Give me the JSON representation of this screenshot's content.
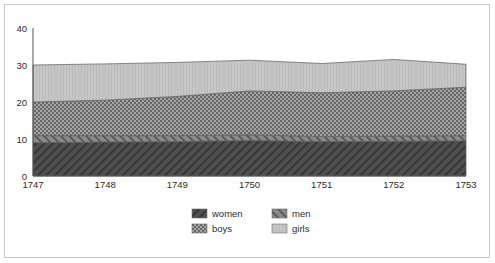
{
  "chart_data": {
    "type": "area",
    "stacked": true,
    "title": "",
    "xlabel": "",
    "ylabel": "",
    "categories": [
      "1747",
      "1748",
      "1749",
      "1750",
      "1751",
      "1752",
      "1753"
    ],
    "x": [
      1747,
      1748,
      1749,
      1750,
      1751,
      1752,
      1753
    ],
    "xlim": [
      1747,
      1753
    ],
    "ylim": [
      0,
      40
    ],
    "yticks": [
      0,
      10,
      20,
      30,
      40
    ],
    "ytick_labels": [
      "0",
      "10",
      "20",
      "30",
      "40"
    ],
    "xtick_labels": [
      "1747",
      "1748",
      "1749",
      "1750",
      "1751",
      "1752",
      "1753"
    ],
    "grid": false,
    "legend_position": "bottom",
    "series": [
      {
        "name": "women",
        "pattern": "diagonal-hatch-dark",
        "color": "#4a4a4a",
        "values": [
          9.0,
          9.2,
          9.3,
          9.6,
          9.3,
          9.4,
          9.5
        ]
      },
      {
        "name": "men",
        "pattern": "diagonal-hatch-medium",
        "color": "#777777",
        "values": [
          1.9,
          1.7,
          1.6,
          1.5,
          1.4,
          1.4,
          1.4
        ]
      },
      {
        "name": "boys",
        "pattern": "checkerboard",
        "color": "#8f8f8f",
        "values": [
          9.1,
          9.6,
          10.6,
          11.9,
          11.8,
          12.2,
          13.1
        ]
      },
      {
        "name": "girls",
        "pattern": "vertical-lines-light",
        "color": "#bdbdbd",
        "values": [
          10.0,
          9.8,
          9.2,
          8.3,
          7.9,
          8.5,
          6.2
        ]
      }
    ],
    "cumulative_tops": {
      "women": [
        9.0,
        9.2,
        9.3,
        9.6,
        9.3,
        9.4,
        9.5
      ],
      "men": [
        10.9,
        10.9,
        10.9,
        11.1,
        10.7,
        10.8,
        10.9
      ],
      "boys": [
        20.0,
        20.5,
        21.5,
        23.0,
        22.5,
        23.0,
        24.0
      ],
      "girls": [
        30.0,
        30.3,
        30.7,
        31.3,
        30.4,
        31.5,
        30.2
      ]
    }
  },
  "legend": {
    "entries": [
      {
        "label": "women"
      },
      {
        "label": "men"
      },
      {
        "label": "boys"
      },
      {
        "label": "girls"
      }
    ]
  }
}
